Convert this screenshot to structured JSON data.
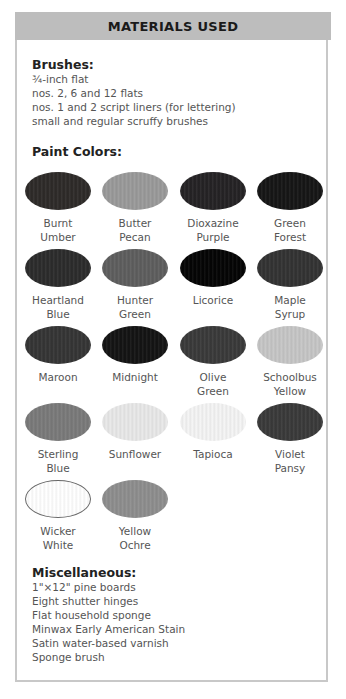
{
  "header": {
    "title": "MATERIALS USED"
  },
  "brushes": {
    "title": "Brushes:",
    "items": [
      "¾-inch flat",
      "nos. 2, 6 and 12 flats",
      "nos. 1 and 2 script liners (for lettering)",
      "small and regular scruffy brushes"
    ]
  },
  "paint_colors": {
    "title": "Paint Colors:",
    "swatches": [
      {
        "line1": "Burnt",
        "line2": "Umber",
        "color": "#2e2b29"
      },
      {
        "line1": "Butter",
        "line2": "Pecan",
        "color": "#9a9a9a"
      },
      {
        "line1": "Dioxazine",
        "line2": "Purple",
        "color": "#252325"
      },
      {
        "line1": "Green",
        "line2": "Forest",
        "color": "#161616"
      },
      {
        "line1": "Heartland",
        "line2": "Blue",
        "color": "#2c2c2c"
      },
      {
        "line1": "Hunter",
        "line2": "Green",
        "color": "#5e5e5e"
      },
      {
        "line1": "Licorice",
        "line2": "",
        "color": "#050505"
      },
      {
        "line1": "Maple",
        "line2": "Syrup",
        "color": "#333333"
      },
      {
        "line1": "Maroon",
        "line2": "",
        "color": "#353535"
      },
      {
        "line1": "Midnight",
        "line2": "",
        "color": "#141414"
      },
      {
        "line1": "Olive",
        "line2": "Green",
        "color": "#3a3a3a"
      },
      {
        "line1": "Schoolbus",
        "line2": "Yellow",
        "color": "#c6c6c6"
      },
      {
        "line1": "Sterling",
        "line2": "Blue",
        "color": "#7a7a7a"
      },
      {
        "line1": "Sunflower",
        "line2": "",
        "color": "#e8e8e8"
      },
      {
        "line1": "Tapioca",
        "line2": "",
        "color": "#f4f4f4"
      },
      {
        "line1": "Violet",
        "line2": "Pansy",
        "color": "#3a3a3a"
      },
      {
        "line1": "Wicker",
        "line2": "White",
        "color": "#ffffff",
        "outlined": true
      },
      {
        "line1": "Yellow",
        "line2": "Ochre",
        "color": "#8e8e8e"
      }
    ]
  },
  "miscellaneous": {
    "title": "Miscellaneous:",
    "items": [
      "1\"×12\" pine boards",
      "Eight shutter hinges",
      "Flat household sponge",
      "Minwax Early American Stain",
      "Satin water-based varnish",
      "Sponge brush"
    ]
  }
}
